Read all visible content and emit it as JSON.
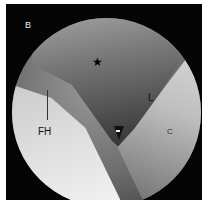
{
  "figure": {
    "panel_label": "B",
    "markers": {
      "star": "★",
      "femoral_head": "FH",
      "labrum": "L",
      "cartilage": "C"
    },
    "colors": {
      "frame": "#050505",
      "border": "#ffffff"
    }
  }
}
